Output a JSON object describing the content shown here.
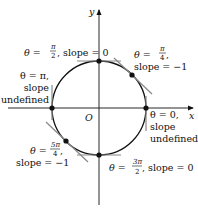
{
  "figure": {
    "axes": {
      "x_label": "x",
      "y_label": "y",
      "origin_label": "O"
    },
    "circle": {
      "cx": 99,
      "cy": 108,
      "r": 48
    },
    "points": [
      {
        "id": "theta-0",
        "theta": "0",
        "slope": "undefined",
        "line1": "θ = 0,",
        "line2": "slope",
        "line3": "undefined"
      },
      {
        "id": "theta-pi-4",
        "theta": "π/4",
        "slope": "−1",
        "prefix": "θ = ",
        "num": "π",
        "den": "4",
        "suffix": ",",
        "line2": "slope = −1"
      },
      {
        "id": "theta-pi-2",
        "theta": "π/2",
        "slope": "0",
        "prefix": "θ = ",
        "num": "π",
        "den": "2",
        "suffix": ", slope = 0"
      },
      {
        "id": "theta-pi",
        "theta": "π",
        "slope": "undefined",
        "line1": "θ = π,",
        "line2": "slope",
        "line3": "undefined"
      },
      {
        "id": "theta-5pi-4",
        "theta": "5π/4",
        "slope": "−1",
        "prefix": "θ = ",
        "num": "5π",
        "den": "4",
        "suffix": ",",
        "line2": "slope = −1"
      },
      {
        "id": "theta-3pi-2",
        "theta": "3π/2",
        "slope": "0",
        "prefix": "θ = ",
        "num": "3π",
        "den": "2",
        "suffix": ", slope = 0"
      }
    ],
    "colors": {
      "curve": "#111111",
      "tangent": "#888888",
      "axis": "#111111"
    }
  }
}
